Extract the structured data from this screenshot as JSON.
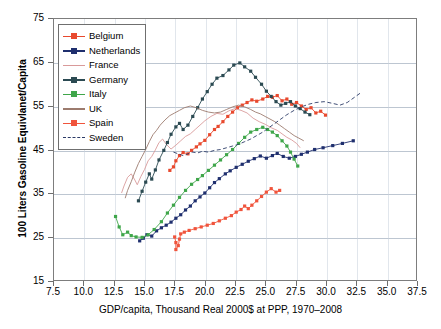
{
  "chart_data": {
    "type": "line",
    "title": "",
    "xlabel": "GDP/capita, Thousand Real 2000$ at PPP, 1970–2008",
    "ylabel": "100 Liters Gasoline Equivlanet/Capita",
    "xlim": [
      7.5,
      37.5
    ],
    "ylim": [
      15,
      75
    ],
    "xticks": [
      "7.5",
      "10.0",
      "12.5",
      "15.0",
      "17.5",
      "20.0",
      "22.5",
      "25.0",
      "27.5",
      "30.0",
      "32.5",
      "35.0",
      "37.5"
    ],
    "yticks": [
      "15",
      "25",
      "35",
      "45",
      "55",
      "65",
      "75"
    ],
    "grid": "horizontal-major-and-vertical-minor",
    "legend_position": "top-left-inside",
    "series": [
      {
        "name": "Belgium",
        "color": "#e8492e",
        "marker": "square",
        "dashed": false,
        "points": [
          [
            17.1,
            40.2
          ],
          [
            17.4,
            41.0
          ],
          [
            17.6,
            42.4
          ],
          [
            17.9,
            43.6
          ],
          [
            18.2,
            44.3
          ],
          [
            18.6,
            44.0
          ],
          [
            18.9,
            44.8
          ],
          [
            19.3,
            45.6
          ],
          [
            19.6,
            46.3
          ],
          [
            20.0,
            47.1
          ],
          [
            20.4,
            48.4
          ],
          [
            20.8,
            49.6
          ],
          [
            21.1,
            50.3
          ],
          [
            21.5,
            51.4
          ],
          [
            21.9,
            52.6
          ],
          [
            22.3,
            53.6
          ],
          [
            22.7,
            54.6
          ],
          [
            23.1,
            55.2
          ],
          [
            23.5,
            55.8
          ],
          [
            23.9,
            56.4
          ],
          [
            24.3,
            56.1
          ],
          [
            24.8,
            56.6
          ],
          [
            25.2,
            57.2
          ],
          [
            25.6,
            57.0
          ],
          [
            26.0,
            57.4
          ],
          [
            26.4,
            56.2
          ],
          [
            26.8,
            56.6
          ],
          [
            27.2,
            55.4
          ],
          [
            27.6,
            55.8
          ],
          [
            28.0,
            55.0
          ],
          [
            28.4,
            54.2
          ],
          [
            28.8,
            54.6
          ],
          [
            29.2,
            53.4
          ],
          [
            29.6,
            53.8
          ],
          [
            30.0,
            52.9
          ]
        ]
      },
      {
        "name": "Netherlands",
        "color": "#1f2f6e",
        "marker": "square",
        "dashed": false,
        "points": [
          [
            14.6,
            24.0
          ],
          [
            14.9,
            24.6
          ],
          [
            15.2,
            25.4
          ],
          [
            15.6,
            25.1
          ],
          [
            16.0,
            26.3
          ],
          [
            16.4,
            27.0
          ],
          [
            16.8,
            27.6
          ],
          [
            17.2,
            28.3
          ],
          [
            17.6,
            29.2
          ],
          [
            18.0,
            30.0
          ],
          [
            18.4,
            31.1
          ],
          [
            18.8,
            32.0
          ],
          [
            19.2,
            33.2
          ],
          [
            19.6,
            34.1
          ],
          [
            20.0,
            35.0
          ],
          [
            20.4,
            36.2
          ],
          [
            20.8,
            37.4
          ],
          [
            21.2,
            38.3
          ],
          [
            21.7,
            39.4
          ],
          [
            22.1,
            40.1
          ],
          [
            22.6,
            40.9
          ],
          [
            23.1,
            41.6
          ],
          [
            23.6,
            42.3
          ],
          [
            24.1,
            42.9
          ],
          [
            24.6,
            43.5
          ],
          [
            25.1,
            43.0
          ],
          [
            25.6,
            43.6
          ],
          [
            26.0,
            44.1
          ],
          [
            26.5,
            43.4
          ],
          [
            27.0,
            43.0
          ],
          [
            27.5,
            43.4
          ],
          [
            28.0,
            43.9
          ],
          [
            28.5,
            44.4
          ],
          [
            29.1,
            45.0
          ],
          [
            29.8,
            45.4
          ],
          [
            30.6,
            45.9
          ],
          [
            31.4,
            46.4
          ],
          [
            32.3,
            47.0
          ]
        ]
      },
      {
        "name": "France",
        "color": "#d99a9a",
        "marker": "none",
        "dashed": false,
        "points": [
          [
            13.1,
            35.0
          ],
          [
            13.3,
            36.6
          ],
          [
            13.6,
            38.6
          ],
          [
            13.9,
            39.4
          ],
          [
            14.2,
            38.0
          ],
          [
            14.4,
            36.9
          ],
          [
            14.7,
            38.8
          ],
          [
            15.0,
            40.4
          ],
          [
            15.3,
            42.4
          ],
          [
            15.6,
            43.4
          ],
          [
            15.9,
            44.9
          ],
          [
            16.2,
            46.6
          ],
          [
            16.5,
            47.4
          ],
          [
            16.8,
            46.2
          ],
          [
            17.2,
            45.1
          ],
          [
            17.6,
            46.0
          ],
          [
            18.0,
            47.0
          ],
          [
            18.4,
            48.0
          ],
          [
            18.8,
            48.6
          ],
          [
            19.2,
            49.6
          ],
          [
            19.6,
            50.6
          ],
          [
            20.0,
            51.6
          ],
          [
            20.5,
            52.6
          ],
          [
            21.0,
            53.3
          ],
          [
            21.5,
            53.1
          ],
          [
            22.0,
            53.9
          ],
          [
            22.5,
            54.4
          ],
          [
            23.0,
            54.0
          ],
          [
            23.5,
            53.4
          ],
          [
            24.0,
            52.2
          ],
          [
            24.5,
            51.4
          ],
          [
            25.0,
            50.8
          ],
          [
            25.5,
            50.0
          ],
          [
            26.0,
            49.4
          ],
          [
            26.4,
            48.6
          ],
          [
            26.8,
            47.8
          ],
          [
            27.2,
            47.2
          ],
          [
            27.6,
            46.4
          ],
          [
            27.9,
            45.4
          ]
        ]
      },
      {
        "name": "Germany",
        "color": "#2b4a52",
        "marker": "square",
        "dashed": false,
        "points": [
          [
            14.5,
            33.2
          ],
          [
            14.8,
            35.4
          ],
          [
            15.1,
            37.5
          ],
          [
            15.4,
            39.4
          ],
          [
            15.6,
            38.2
          ],
          [
            15.9,
            40.3
          ],
          [
            16.2,
            42.6
          ],
          [
            16.6,
            44.8
          ],
          [
            16.9,
            46.6
          ],
          [
            17.2,
            48.5
          ],
          [
            17.6,
            50.2
          ],
          [
            17.9,
            51.0
          ],
          [
            18.2,
            49.6
          ],
          [
            18.6,
            50.6
          ],
          [
            19.0,
            52.6
          ],
          [
            19.4,
            54.6
          ],
          [
            19.8,
            56.6
          ],
          [
            20.2,
            58.3
          ],
          [
            20.6,
            60.0
          ],
          [
            21.0,
            61.4
          ],
          [
            21.5,
            62.0
          ],
          [
            22.0,
            63.3
          ],
          [
            22.4,
            64.4
          ],
          [
            22.9,
            64.9
          ],
          [
            23.3,
            64.0
          ],
          [
            23.8,
            63.0
          ],
          [
            24.2,
            61.6
          ],
          [
            24.7,
            60.0
          ],
          [
            25.1,
            58.4
          ],
          [
            25.5,
            57.2
          ],
          [
            25.9,
            56.0
          ],
          [
            26.3,
            55.2
          ],
          [
            26.7,
            55.6
          ],
          [
            27.1,
            56.0
          ],
          [
            27.5,
            55.0
          ],
          [
            27.9,
            54.4
          ],
          [
            28.3,
            53.6
          ],
          [
            28.7,
            53.0
          ]
        ]
      },
      {
        "name": "Italy",
        "color": "#3fa64a",
        "marker": "square",
        "dashed": false,
        "points": [
          [
            12.6,
            29.6
          ],
          [
            12.9,
            27.2
          ],
          [
            13.2,
            25.4
          ],
          [
            13.6,
            26.0
          ],
          [
            13.9,
            25.2
          ],
          [
            14.3,
            24.9
          ],
          [
            14.8,
            24.8
          ],
          [
            15.3,
            25.4
          ],
          [
            15.8,
            26.6
          ],
          [
            16.4,
            28.4
          ],
          [
            16.9,
            30.4
          ],
          [
            17.4,
            32.2
          ],
          [
            17.9,
            34.0
          ],
          [
            18.4,
            35.6
          ],
          [
            18.9,
            37.0
          ],
          [
            19.4,
            38.1
          ],
          [
            19.8,
            39.0
          ],
          [
            20.3,
            40.2
          ],
          [
            20.8,
            41.4
          ],
          [
            21.3,
            42.6
          ],
          [
            21.8,
            43.8
          ],
          [
            22.3,
            45.0
          ],
          [
            22.8,
            46.4
          ],
          [
            23.3,
            47.8
          ],
          [
            23.8,
            49.0
          ],
          [
            24.3,
            49.6
          ],
          [
            24.8,
            50.1
          ],
          [
            25.2,
            49.6
          ],
          [
            25.6,
            49.0
          ],
          [
            26.0,
            48.2
          ],
          [
            26.4,
            47.0
          ],
          [
            26.8,
            45.8
          ],
          [
            27.1,
            44.4
          ],
          [
            27.4,
            42.8
          ],
          [
            27.7,
            41.2
          ]
        ]
      },
      {
        "name": "UK",
        "color": "#9c7b6e",
        "marker": "none",
        "dashed": false,
        "points": [
          [
            13.4,
            33.8
          ],
          [
            13.6,
            35.6
          ],
          [
            13.9,
            37.6
          ],
          [
            14.2,
            39.8
          ],
          [
            14.5,
            41.8
          ],
          [
            14.8,
            43.4
          ],
          [
            15.1,
            45.0
          ],
          [
            15.4,
            46.8
          ],
          [
            15.7,
            48.4
          ],
          [
            16.0,
            49.4
          ],
          [
            16.3,
            50.6
          ],
          [
            16.7,
            51.8
          ],
          [
            17.1,
            52.8
          ],
          [
            17.5,
            53.4
          ],
          [
            17.9,
            54.0
          ],
          [
            18.3,
            54.6
          ],
          [
            18.8,
            55.0
          ],
          [
            19.3,
            54.6
          ],
          [
            19.8,
            54.0
          ],
          [
            20.3,
            53.6
          ],
          [
            20.8,
            53.4
          ],
          [
            21.3,
            53.6
          ],
          [
            21.8,
            54.2
          ],
          [
            22.3,
            54.8
          ],
          [
            22.8,
            55.2
          ],
          [
            23.3,
            54.8
          ],
          [
            23.8,
            54.2
          ],
          [
            24.2,
            53.6
          ],
          [
            24.6,
            53.2
          ],
          [
            25.0,
            52.6
          ],
          [
            25.4,
            52.0
          ],
          [
            25.8,
            51.4
          ],
          [
            26.2,
            50.6
          ],
          [
            26.6,
            49.8
          ],
          [
            27.0,
            49.0
          ],
          [
            27.4,
            48.2
          ],
          [
            27.8,
            47.6
          ],
          [
            28.2,
            47.0
          ]
        ]
      },
      {
        "name": "Spain",
        "color": "#f0543c",
        "marker": "square",
        "dashed": false,
        "points": [
          [
            17.5,
            24.9
          ],
          [
            17.6,
            23.6
          ],
          [
            17.6,
            22.0
          ],
          [
            17.8,
            22.9
          ],
          [
            17.9,
            24.4
          ],
          [
            18.0,
            25.6
          ],
          [
            18.3,
            26.0
          ],
          [
            18.7,
            26.4
          ],
          [
            19.2,
            26.8
          ],
          [
            19.7,
            27.2
          ],
          [
            20.2,
            27.6
          ],
          [
            20.7,
            28.0
          ],
          [
            21.2,
            28.6
          ],
          [
            21.7,
            29.2
          ],
          [
            22.2,
            29.8
          ],
          [
            22.6,
            30.6
          ],
          [
            23.0,
            31.2
          ],
          [
            23.3,
            32.0
          ],
          [
            23.6,
            31.4
          ],
          [
            23.9,
            32.2
          ],
          [
            24.3,
            33.2
          ],
          [
            24.7,
            34.2
          ],
          [
            25.1,
            35.2
          ],
          [
            25.5,
            36.0
          ],
          [
            25.9,
            35.2
          ],
          [
            26.2,
            35.6
          ]
        ]
      },
      {
        "name": "Sweden",
        "color": "#2b3a66",
        "marker": "none",
        "dashed": true,
        "points": [
          [
            17.4,
            44.4
          ],
          [
            17.8,
            44.0
          ],
          [
            18.2,
            43.6
          ],
          [
            18.6,
            44.0
          ],
          [
            19.0,
            44.4
          ],
          [
            19.4,
            44.2
          ],
          [
            19.8,
            44.6
          ],
          [
            20.3,
            44.4
          ],
          [
            20.8,
            44.8
          ],
          [
            21.3,
            45.0
          ],
          [
            21.8,
            45.4
          ],
          [
            22.3,
            45.8
          ],
          [
            22.8,
            46.2
          ],
          [
            23.3,
            46.8
          ],
          [
            23.8,
            47.4
          ],
          [
            24.3,
            48.2
          ],
          [
            24.8,
            49.0
          ],
          [
            25.3,
            50.0
          ],
          [
            25.8,
            51.0
          ],
          [
            26.3,
            52.0
          ],
          [
            26.8,
            53.0
          ],
          [
            27.4,
            54.0
          ],
          [
            28.0,
            54.8
          ],
          [
            28.6,
            55.4
          ],
          [
            29.2,
            55.8
          ],
          [
            29.9,
            56.0
          ],
          [
            30.6,
            55.6
          ],
          [
            31.2,
            55.2
          ],
          [
            31.8,
            55.8
          ],
          [
            32.4,
            57.0
          ],
          [
            32.9,
            58.0
          ]
        ]
      }
    ]
  }
}
